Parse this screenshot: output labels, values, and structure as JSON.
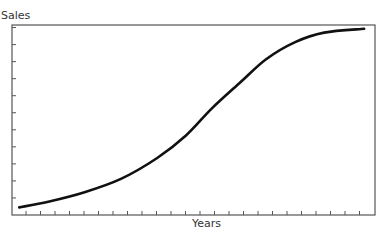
{
  "chart_data": {
    "type": "line",
    "title": "",
    "xlabel": "Years",
    "ylabel": "Sales",
    "grid": false,
    "legend": null,
    "x_tick_count": 24,
    "y_tick_count": 11,
    "x_ticks_labeled": false,
    "y_ticks_labeled": false,
    "series": [
      {
        "name": "Sales S-curve",
        "color": "#111111",
        "points_normalized": [
          [
            0.02,
            0.04
          ],
          [
            0.1,
            0.07
          ],
          [
            0.2,
            0.12
          ],
          [
            0.3,
            0.19
          ],
          [
            0.4,
            0.3
          ],
          [
            0.48,
            0.42
          ],
          [
            0.55,
            0.56
          ],
          [
            0.63,
            0.7
          ],
          [
            0.7,
            0.82
          ],
          [
            0.78,
            0.91
          ],
          [
            0.86,
            0.96
          ],
          [
            0.97,
            0.98
          ]
        ]
      }
    ],
    "xlim": [
      0,
      1
    ],
    "ylim": [
      0,
      1
    ]
  },
  "axes": {
    "x_label": "Years",
    "y_label": "Sales"
  }
}
